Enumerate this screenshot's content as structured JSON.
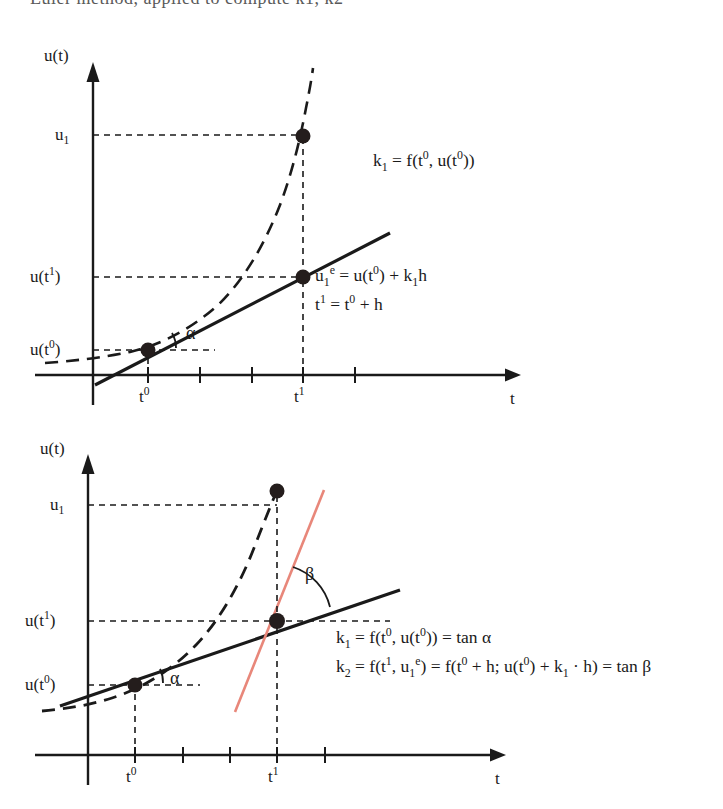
{
  "page": {
    "top_clipped_text": "Euler method, applied to compute k1, k2"
  },
  "colors": {
    "ink": "#1a1a1a",
    "secant_red": "#e8877a",
    "background": "#ffffff"
  },
  "figure1": {
    "name": "euler-explicit-step-diagram",
    "y_axis_label": "u(t)",
    "x_axis_label": "t",
    "y_ticks": [
      {
        "id": "u1",
        "text_html": "u<sub>1</sub>",
        "plain": "u1",
        "y": 105
      },
      {
        "id": "ut1",
        "text_html": "u(t<sup>1</sup>)",
        "plain": "u(t1)",
        "y": 247
      },
      {
        "id": "ut0",
        "text_html": "u(t<sup>0</sup>)",
        "plain": "u(t0)",
        "y": 320
      }
    ],
    "x_ticks": [
      {
        "id": "t0",
        "text_html": "t<sup>0</sup>",
        "plain": "t0",
        "x": 148
      },
      {
        "id": "t1",
        "text_html": "t<sup>1</sup>",
        "plain": "t1",
        "x": 303
      }
    ],
    "angle_labels": [
      {
        "id": "alpha",
        "text": "α",
        "x": 186,
        "y": 303
      }
    ],
    "formulas": [
      {
        "id": "k1",
        "html": "k<sub>1</sub> = f(t<sup>0</sup>, u(t<sup>0</sup>))",
        "plain": "k1 = f(t0, u(t0))",
        "x": 373,
        "y": 130
      },
      {
        "id": "ue1",
        "html": "u<sub>1</sub><sup>e</sup> = u(t<sup>0</sup>) + k<sub>1</sub>h",
        "plain": "u1e = u(t0) + k1h",
        "x": 315,
        "y": 245
      },
      {
        "id": "t1eq",
        "html": "t<sup>1</sup> = t<sup>0</sup> + h",
        "plain": "t1 = t0 + h",
        "x": 315,
        "y": 274
      }
    ],
    "points": [
      {
        "id": "exact-u1",
        "x": 303,
        "y": 106
      },
      {
        "id": "euler-ue1",
        "x": 303,
        "y": 247
      },
      {
        "id": "start-ut0",
        "x": 148,
        "y": 320
      }
    ]
  },
  "figure2": {
    "name": "heun-two-slope-diagram",
    "y_axis_label": "u(t)",
    "x_axis_label": "t",
    "y_ticks": [
      {
        "id": "u1",
        "text_html": "u<sub>1</sub>",
        "plain": "u1",
        "y": 505
      },
      {
        "id": "ut1",
        "text_html": "u(t<sup>1</sup>)",
        "plain": "u(t1)",
        "y": 617
      },
      {
        "id": "ut0",
        "text_html": "u(t<sup>0</sup>)",
        "plain": "u(t0)",
        "y": 683
      }
    ],
    "x_ticks": [
      {
        "id": "t0",
        "text_html": "t<sup>0</sup>",
        "plain": "t0",
        "x": 135
      },
      {
        "id": "t1",
        "text_html": "t<sup>1</sup>",
        "plain": "t1",
        "x": 277
      }
    ],
    "angle_labels": [
      {
        "id": "alpha",
        "text": "α",
        "x": 170,
        "y": 669
      },
      {
        "id": "beta",
        "text": "β",
        "x": 305,
        "y": 575
      }
    ],
    "formulas": [
      {
        "id": "k1",
        "html": "k<sub>1</sub> = f(t<sup>0</sup>, u(t<sup>0</sup>)) = tan α",
        "plain": "k1 = f(t0, u(t0)) = tan alpha",
        "x": 336,
        "y": 638
      },
      {
        "id": "k2",
        "html": "k<sub>2</sub> = f(t<sup>1</sup>, u<sub>1</sub><sup>e</sup>) = f(t<sup>0</sup> + h; u(t<sup>0</sup>) + k<sub>1</sub> · h) = tan β",
        "plain": "k2 = f(t1, u1e) = f(t0 + h; u(t0) + k1 . h) = tan beta",
        "x": 336,
        "y": 667
      }
    ],
    "points": [
      {
        "id": "exact-u1",
        "x": 277,
        "y": 491
      },
      {
        "id": "euler-ue1",
        "x": 277,
        "y": 621
      },
      {
        "id": "start-ut0",
        "x": 135,
        "y": 685
      }
    ]
  }
}
